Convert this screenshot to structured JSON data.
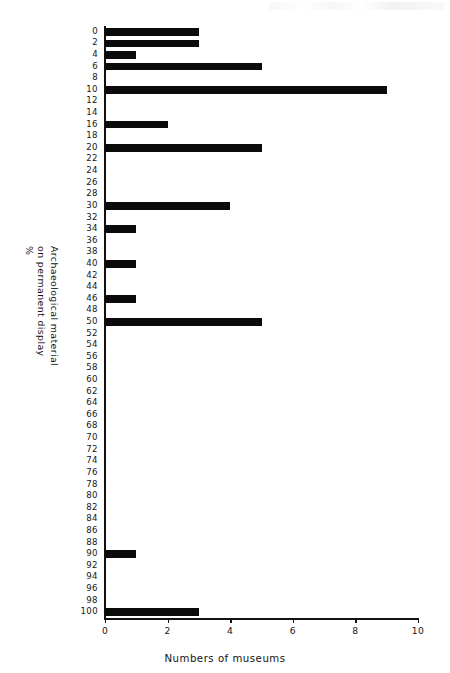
{
  "figure": {
    "background_color": "#ffffff",
    "bar_color": "#0b0b0b",
    "axis_color": "#111111",
    "x_axis_title": "Numbers of museums",
    "y_axis_title_lines": [
      "Archaeological material",
      "on permanent display",
      "%"
    ]
  },
  "chart_data": {
    "type": "bar",
    "orientation": "horizontal",
    "title": "",
    "subtitle": "",
    "xlabel": "Numbers of museums",
    "ylabel": "Archaeological material on permanent display %",
    "xlim": [
      0,
      10
    ],
    "ylim": [
      0,
      100
    ],
    "x_ticks": [
      0,
      2,
      4,
      6,
      8,
      10
    ],
    "x_tick_labels": [
      "0",
      "2",
      "4",
      "6",
      "8",
      "10"
    ],
    "y_ticks": [
      0,
      2,
      4,
      6,
      8,
      10,
      12,
      14,
      16,
      18,
      20,
      22,
      24,
      26,
      28,
      30,
      32,
      34,
      36,
      38,
      40,
      42,
      44,
      46,
      48,
      50,
      52,
      54,
      56,
      58,
      60,
      62,
      64,
      66,
      68,
      70,
      72,
      74,
      76,
      78,
      80,
      82,
      84,
      86,
      88,
      90,
      92,
      94,
      96,
      98,
      100
    ],
    "y_tick_labels": [
      "0",
      "2",
      "4",
      "6",
      "8",
      "10",
      "12",
      "14",
      "16",
      "18",
      "20",
      "22",
      "24",
      "26",
      "28",
      "30",
      "32",
      "34",
      "36",
      "38",
      "40",
      "42",
      "44",
      "46",
      "48",
      "50",
      "52",
      "54",
      "56",
      "58",
      "60",
      "62",
      "64",
      "66",
      "68",
      "70",
      "72",
      "74",
      "76",
      "78",
      "80",
      "82",
      "84",
      "86",
      "88",
      "90",
      "92",
      "94",
      "96",
      "98",
      "100"
    ],
    "grid": false,
    "legend": null,
    "categories": [
      0,
      2,
      4,
      6,
      8,
      10,
      12,
      14,
      16,
      18,
      20,
      22,
      24,
      26,
      28,
      30,
      32,
      34,
      36,
      38,
      40,
      42,
      44,
      46,
      48,
      50,
      52,
      54,
      56,
      58,
      60,
      62,
      64,
      66,
      68,
      70,
      72,
      74,
      76,
      78,
      80,
      82,
      84,
      86,
      88,
      90,
      92,
      94,
      96,
      98,
      100
    ],
    "values": [
      3,
      3,
      1,
      5,
      0,
      9,
      0,
      0,
      2,
      0,
      5,
      0,
      0,
      0,
      0,
      4,
      0,
      1,
      0,
      0,
      1,
      0,
      0,
      1,
      0,
      5,
      0,
      0,
      0,
      0,
      0,
      0,
      0,
      0,
      0,
      0,
      0,
      0,
      0,
      0,
      0,
      0,
      0,
      0,
      0,
      1,
      0,
      0,
      0,
      0,
      3
    ]
  }
}
